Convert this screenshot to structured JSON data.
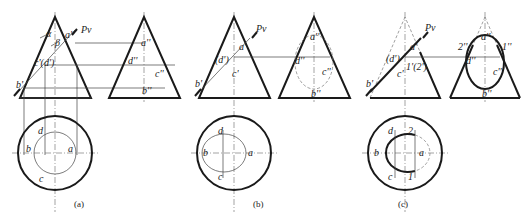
{
  "figure": {
    "panels": [
      {
        "caption": "(a)",
        "front_labels": {
          "a": "a'",
          "b": "b'",
          "cd": "c'(d')",
          "alpha": "α",
          "beta": "β",
          "pv": "Pv"
        },
        "side_labels": {
          "a": "a''",
          "d": "d''",
          "c": "c''",
          "b": "b''"
        },
        "top_labels": {
          "a": "a",
          "b": "b",
          "c": "c",
          "d": "d"
        }
      },
      {
        "caption": "(b)",
        "front_labels": {
          "a": "a'",
          "b": "b'",
          "c": "c'",
          "d": "(d')",
          "pv": "Pv"
        },
        "side_labels": {
          "a": "a''",
          "d": "d''",
          "c": "c''",
          "b": "b''"
        },
        "top_labels": {
          "a": "a",
          "b": "b",
          "c": "c",
          "d": "d"
        }
      },
      {
        "caption": "(c)",
        "front_labels": {
          "a": "a'",
          "b": "b'",
          "c": "c'",
          "d": "(d')",
          "p12": "1'(2')",
          "pv": "Pv"
        },
        "side_labels": {
          "a": "a''",
          "d": "d''",
          "c": "c''",
          "b": "b''",
          "p1": "1''",
          "p2": "2''"
        },
        "top_labels": {
          "a": "a",
          "b": "b",
          "c": "c",
          "d": "d",
          "p1": "1",
          "p2": "2"
        }
      }
    ]
  }
}
